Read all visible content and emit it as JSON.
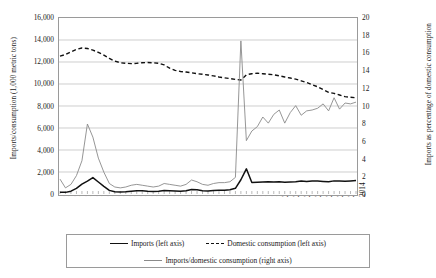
{
  "axes": {
    "left_title": "Imports/consumption (1,000 metric tons)",
    "right_title": "Imports as percentage of domestic consumption",
    "left_ticks": [
      "16,000",
      "14,000",
      "12,000",
      "10,000",
      "8,000",
      "6,000",
      "4,000",
      "2,000",
      "0"
    ],
    "right_ticks": [
      "20",
      "18",
      "16",
      "14",
      "12",
      "10",
      "8",
      "6",
      "4",
      "2",
      "0"
    ]
  },
  "legend": {
    "imports": "Imports (left axis)",
    "domestic": "Domestic consumption (left axis)",
    "ratio": "Imports/domestic consumption (right axis)"
  },
  "chart_data": {
    "type": "line",
    "title": "",
    "xlabel": "",
    "ylabel": "Imports/consumption (1,000 metric tons)",
    "y2label": "Imports as percentage of domestic consumption",
    "ylim": [
      0,
      16000
    ],
    "y2lim": [
      0,
      20
    ],
    "ytick_step": 2000,
    "y2tick_step": 2,
    "grid": "horizontal",
    "legend_position": "bottom",
    "xlim": [
      1960,
      2014
    ],
    "xtick_step": 2,
    "x": [
      1960,
      1961,
      1962,
      1963,
      1964,
      1965,
      1966,
      1967,
      1968,
      1969,
      1970,
      1971,
      1972,
      1973,
      1974,
      1975,
      1976,
      1977,
      1978,
      1979,
      1980,
      1981,
      1982,
      1983,
      1984,
      1985,
      1986,
      1987,
      1988,
      1989,
      1990,
      1991,
      1992,
      1993,
      1994,
      1995,
      1996,
      1997,
      1998,
      1999,
      2000,
      2001,
      2002,
      2003,
      2004,
      2005,
      2006,
      2007,
      2008,
      2009,
      2010,
      2011,
      2012,
      2013,
      2014
    ],
    "xticklabels": [
      "1960",
      "1962",
      "1964",
      "1966",
      "1968",
      "1970",
      "1972",
      "1974",
      "1976",
      "1978",
      "1980",
      "1982",
      "1984",
      "1986",
      "1988",
      "1990",
      "1992",
      "1994",
      "1996",
      "1998",
      "2000",
      "2002",
      "2004",
      "2006",
      "2008",
      "2010",
      "2012",
      "2014"
    ],
    "series": [
      {
        "name": "Imports (left axis)",
        "axis": "left",
        "style": "solid",
        "color": "#111111",
        "values": [
          170,
          150,
          260,
          520,
          900,
          1180,
          1500,
          1100,
          700,
          330,
          200,
          180,
          210,
          260,
          300,
          290,
          250,
          230,
          260,
          330,
          300,
          270,
          250,
          300,
          420,
          380,
          300,
          280,
          310,
          350,
          340,
          380,
          520,
          1300,
          2300,
          1050,
          1080,
          1100,
          1130,
          1100,
          1120,
          1080,
          1100,
          1120,
          1180,
          1150,
          1200,
          1180,
          1150,
          1130,
          1200,
          1190,
          1170,
          1200,
          1230
        ]
      },
      {
        "name": "Domestic consumption (left axis)",
        "axis": "left",
        "style": "dashed",
        "color": "#111111",
        "values": [
          12600,
          12750,
          13000,
          13220,
          13350,
          13300,
          13150,
          12950,
          12700,
          12400,
          12150,
          12000,
          11950,
          11920,
          11950,
          12000,
          12020,
          12000,
          11950,
          11800,
          11500,
          11300,
          11200,
          11150,
          11080,
          11000,
          10950,
          10880,
          10800,
          10700,
          10620,
          10550,
          10480,
          10420,
          10900,
          11000,
          11050,
          11000,
          10950,
          10900,
          10800,
          10700,
          10600,
          10500,
          10350,
          10200,
          10000,
          9800,
          9550,
          9300,
          9200,
          9050,
          8900,
          8850,
          8800
        ]
      },
      {
        "name": "Imports/domestic consumption (right axis)",
        "axis": "right",
        "style": "solid",
        "color": "#8a8a8a",
        "values": [
          1.7,
          0.7,
          1.1,
          2.1,
          3.8,
          8.0,
          6.5,
          4.1,
          2.5,
          1.2,
          0.8,
          0.7,
          0.8,
          1.0,
          1.1,
          1.0,
          0.9,
          0.8,
          0.9,
          1.2,
          1.1,
          1.0,
          0.9,
          1.1,
          1.6,
          1.4,
          1.1,
          1.0,
          1.2,
          1.3,
          1.3,
          1.4,
          1.9,
          17.5,
          6.1,
          7.2,
          7.7,
          8.8,
          8.1,
          9.1,
          9.6,
          8.1,
          9.3,
          10.1,
          9.0,
          9.5,
          9.6,
          9.8,
          10.3,
          9.5,
          11.0,
          9.7,
          10.4,
          10.3,
          10.5
        ]
      }
    ]
  }
}
